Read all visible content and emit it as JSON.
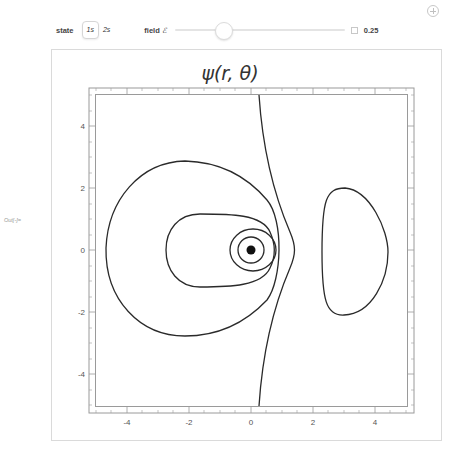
{
  "toolbar": {
    "add_icon": "plus-circle-icon"
  },
  "controls": {
    "state_label": "state",
    "state_options": [
      "1s",
      "2s"
    ],
    "state_selected": "1s",
    "field_label": "field",
    "field_symbol": "ℰ",
    "field_value": "0.25",
    "field_slider_position": 0.25
  },
  "output": {
    "label": "Out[-]="
  },
  "plot": {
    "title": "ψ(r, θ)",
    "x_ticks": [
      "-4",
      "-2",
      "0",
      "2",
      "4"
    ],
    "y_ticks": [
      "4",
      "2",
      "0",
      "-2",
      "-4"
    ],
    "x_range": [
      -5.2,
      5.2
    ],
    "y_range": [
      -5.2,
      5.2
    ],
    "line_color": "#222222",
    "frame_color": "#888888"
  }
}
